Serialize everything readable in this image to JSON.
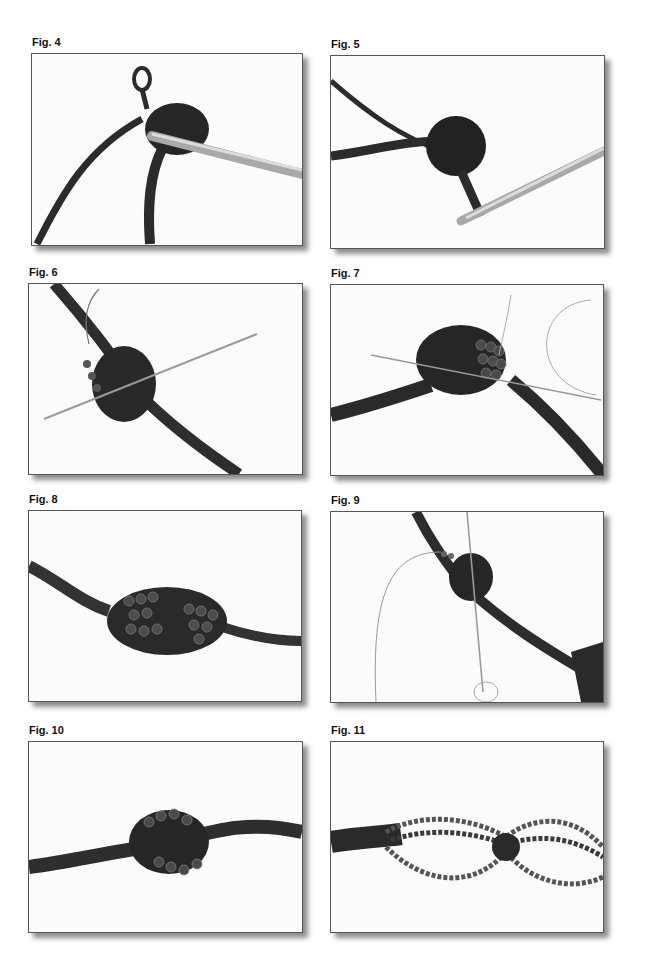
{
  "page": {
    "figures": [
      {
        "label": "Fig. 4",
        "subject": "crochet hook working chain loop into coil",
        "icon": "crochet-hook-photo"
      },
      {
        "label": "Fig. 5",
        "subject": "crochet hook pulling loop through coiled cord",
        "icon": "crochet-hook-photo"
      },
      {
        "label": "Fig. 6",
        "subject": "beading needle threaded through coil with beads",
        "icon": "needle-photo"
      },
      {
        "label": "Fig. 7",
        "subject": "beads wrapped around coil with needle",
        "icon": "needle-photo"
      },
      {
        "label": "Fig. 8",
        "subject": "beaded knot on cord",
        "icon": "beaded-knot-photo"
      },
      {
        "label": "Fig. 9",
        "subject": "needle passing through beaded knot on cord",
        "icon": "needle-photo"
      },
      {
        "label": "Fig. 10",
        "subject": "finished beaded knot on twisted cord",
        "icon": "beaded-knot-photo"
      },
      {
        "label": "Fig. 11",
        "subject": "bead strands looped around cord",
        "icon": "bead-strands-photo"
      }
    ]
  }
}
